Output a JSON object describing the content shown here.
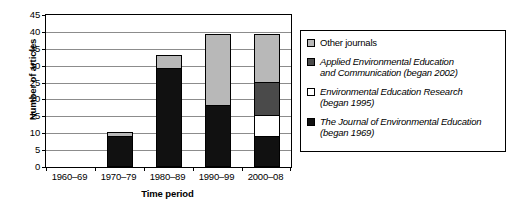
{
  "chart_data": {
    "type": "bar",
    "subtype": "stacked-bar",
    "title": "",
    "xlabel": "Time period",
    "ylabel": "Number of articles",
    "categories": [
      "1960–69",
      "1970–79",
      "1980–89",
      "1990–99",
      "2000–08"
    ],
    "ylim": [
      0,
      45
    ],
    "ytick_step": 5,
    "yticks": [
      45,
      40,
      35,
      30,
      25,
      20,
      15,
      10,
      5,
      0
    ],
    "grid": true,
    "grid_axis": "y",
    "legend_position": "right",
    "stack_order_bottom_to_top": [
      "The Journal of Environmental Education (began 1969)",
      "Environmental Education Research (began 1995)",
      "Applied Environmental Education and Communication (began 2002)",
      "Other journals"
    ],
    "series": [
      {
        "name": "Other journals",
        "color": "#b8b8b8",
        "values": [
          0,
          1,
          4,
          21,
          14
        ]
      },
      {
        "name": "Applied Environmental Education and Communication (began 2002)",
        "color": "#4a4a4a",
        "values": [
          0,
          0,
          0,
          0,
          10
        ]
      },
      {
        "name": "Environmental Education Research (began 1995)",
        "color": "#ffffff",
        "values": [
          0,
          0,
          0,
          0,
          6
        ]
      },
      {
        "name": "The Journal of Environmental Education (began 1969)",
        "color": "#111111",
        "values": [
          0,
          9,
          29,
          18,
          9
        ]
      }
    ],
    "totals": [
      0,
      10,
      33,
      39,
      39
    ]
  },
  "axes": {
    "y_title": "Number of articles",
    "x_title": "Time period",
    "y_tick_labels": [
      "45",
      "40",
      "35",
      "30",
      "25",
      "20",
      "15",
      "10",
      "5",
      "0"
    ],
    "x_tick_labels": [
      "1960–69",
      "1970–79",
      "1980–89",
      "1990–99",
      "2000–08"
    ]
  },
  "legend": {
    "items": [
      {
        "swatch": "light-grey",
        "color": "#b8b8b8",
        "italic": false,
        "line1": "Other journals",
        "line2": ""
      },
      {
        "swatch": "dark-grey",
        "color": "#4a4a4a",
        "italic": true,
        "line1": "Applied Environmental Education",
        "line2": "and Communication (began 2002)"
      },
      {
        "swatch": "white",
        "color": "#ffffff",
        "italic": true,
        "line1": "Environmental Education Research",
        "line2": "(began 1995)"
      },
      {
        "swatch": "black",
        "color": "#111111",
        "italic": true,
        "line1": "The Journal of Environmental Education",
        "line2": "(began 1969)"
      }
    ]
  },
  "colors": {
    "other_journals": "#b8b8b8",
    "applied_eec": "#4a4a4a",
    "eer": "#ffffff",
    "jee": "#111111",
    "gridline": "#8c8c8c",
    "frame": "#000000",
    "background": "#ffffff"
  }
}
